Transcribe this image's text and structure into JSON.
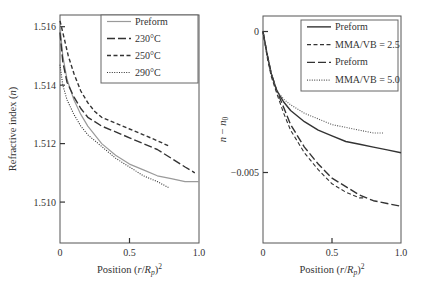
{
  "chart_data": [
    {
      "type": "line",
      "title": "",
      "xlabel": "Position (r/R_p)^2",
      "ylabel": "Refractive index (n)",
      "xlim": [
        0,
        1.0
      ],
      "ylim": [
        1.5086,
        1.5164
      ],
      "xticks": [
        0,
        0.5,
        1.0
      ],
      "xtick_labels": [
        "0",
        "0.5",
        "1.0"
      ],
      "yticks": [
        1.51,
        1.512,
        1.514,
        1.516
      ],
      "ytick_labels": [
        "1.510",
        "1.512",
        "1.514",
        "1.516"
      ],
      "grid": false,
      "legend_position": "upper right",
      "series": [
        {
          "name": "Preform",
          "style": "solid",
          "color": "#9a9a9a",
          "width": 1.2,
          "x": [
            0,
            0.02,
            0.05,
            0.1,
            0.15,
            0.2,
            0.3,
            0.4,
            0.5,
            0.6,
            0.7,
            0.8,
            0.9,
            1.0
          ],
          "y": [
            1.516,
            1.515,
            1.5142,
            1.5135,
            1.513,
            1.5126,
            1.512,
            1.5116,
            1.5113,
            1.5111,
            1.5109,
            1.5108,
            1.5107,
            1.5107
          ]
        },
        {
          "name": "230°C",
          "style": "longdash",
          "color": "#333333",
          "width": 1.4,
          "x": [
            0,
            0.02,
            0.05,
            0.1,
            0.15,
            0.2,
            0.3,
            0.4,
            0.5,
            0.6,
            0.7,
            0.8,
            0.9,
            0.97
          ],
          "y": [
            1.5158,
            1.5148,
            1.5141,
            1.5136,
            1.5132,
            1.5129,
            1.5126,
            1.5124,
            1.5122,
            1.512,
            1.5118,
            1.5115,
            1.5112,
            1.511
          ]
        },
        {
          "name": "250°C",
          "style": "dash",
          "color": "#333333",
          "width": 1.4,
          "x": [
            0,
            0.03,
            0.06,
            0.1,
            0.15,
            0.2,
            0.25,
            0.3,
            0.4,
            0.5,
            0.6,
            0.7,
            0.79
          ],
          "y": [
            1.5162,
            1.5156,
            1.515,
            1.5144,
            1.5138,
            1.5134,
            1.5131,
            1.5129,
            1.5127,
            1.5125,
            1.5123,
            1.5121,
            1.5119
          ]
        },
        {
          "name": "290°C",
          "style": "dot",
          "color": "#333333",
          "width": 1.1,
          "x": [
            0,
            0.02,
            0.05,
            0.1,
            0.15,
            0.2,
            0.3,
            0.4,
            0.5,
            0.6,
            0.7,
            0.78
          ],
          "y": [
            1.5147,
            1.514,
            1.5135,
            1.513,
            1.5126,
            1.5123,
            1.5119,
            1.5115,
            1.5112,
            1.5109,
            1.5107,
            1.5105
          ]
        }
      ]
    },
    {
      "type": "line",
      "title": "",
      "xlabel": "Position (r/R_p)^2",
      "ylabel": "n − n0",
      "xlim": [
        0,
        1.0
      ],
      "ylim": [
        -0.0075,
        0.00055
      ],
      "xticks": [
        0,
        0.5,
        1.0
      ],
      "xtick_labels": [
        "0",
        "0.5",
        "1.0"
      ],
      "yticks": [
        0,
        -0.005
      ],
      "ytick_labels": [
        "0",
        "−0.005"
      ],
      "grid": false,
      "legend_position": "upper right",
      "series": [
        {
          "name": "Preform",
          "style": "solid",
          "color": "#333333",
          "width": 1.4,
          "x": [
            0,
            0.03,
            0.06,
            0.1,
            0.15,
            0.2,
            0.3,
            0.4,
            0.5,
            0.6,
            0.7,
            0.8,
            0.9,
            1.0
          ],
          "y": [
            0,
            -0.0008,
            -0.0015,
            -0.0021,
            -0.0025,
            -0.0028,
            -0.0032,
            -0.0035,
            -0.0037,
            -0.0039,
            -0.004,
            -0.0041,
            -0.0042,
            -0.0043
          ]
        },
        {
          "name": "MMA/VB = 2.5",
          "style": "dash",
          "color": "#333333",
          "width": 1.1,
          "x": [
            0,
            0.03,
            0.06,
            0.1,
            0.15,
            0.2,
            0.3,
            0.4,
            0.5,
            0.6,
            0.7,
            0.73
          ],
          "y": [
            0,
            -0.0009,
            -0.0016,
            -0.0022,
            -0.0029,
            -0.0035,
            -0.0043,
            -0.0049,
            -0.0054,
            -0.0057,
            -0.0059,
            -0.0059
          ]
        },
        {
          "name": "Preform",
          "style": "longdash",
          "color": "#333333",
          "width": 1.4,
          "x": [
            0,
            0.03,
            0.06,
            0.1,
            0.15,
            0.2,
            0.3,
            0.4,
            0.5,
            0.6,
            0.7,
            0.8,
            0.9,
            1.0
          ],
          "y": [
            0,
            -0.0008,
            -0.0015,
            -0.0021,
            -0.0027,
            -0.0033,
            -0.0041,
            -0.0047,
            -0.0052,
            -0.0055,
            -0.0058,
            -0.006,
            -0.0061,
            -0.0062
          ]
        },
        {
          "name": "MMA/VB = 5.0",
          "style": "dot",
          "color": "#555555",
          "width": 1.1,
          "x": [
            0,
            0.03,
            0.06,
            0.1,
            0.15,
            0.2,
            0.3,
            0.4,
            0.5,
            0.6,
            0.7,
            0.8,
            0.87
          ],
          "y": [
            0,
            -0.0008,
            -0.0015,
            -0.0021,
            -0.0024,
            -0.0026,
            -0.0029,
            -0.0031,
            -0.0033,
            -0.0034,
            -0.0035,
            -0.0036,
            -0.0036
          ]
        }
      ]
    }
  ],
  "panels": [
    {
      "frame": {
        "x0": 60,
        "y0": 15,
        "x1": 199,
        "y1": 243
      },
      "xlabel": "Position (r/Rp)",
      "xlabel_sup": "2",
      "ylabel": "Refractive index (n)",
      "legend": {
        "x": 101,
        "y": 15,
        "w": 97,
        "h": 68
      }
    },
    {
      "frame": {
        "x0": 263,
        "y0": 16,
        "x1": 401,
        "y1": 243
      },
      "xlabel": "Position (r/Rp)",
      "xlabel_sup": "2",
      "ylabel": "n − n0",
      "legend": {
        "x": 301,
        "y": 20,
        "w": 97,
        "h": 71
      }
    }
  ]
}
